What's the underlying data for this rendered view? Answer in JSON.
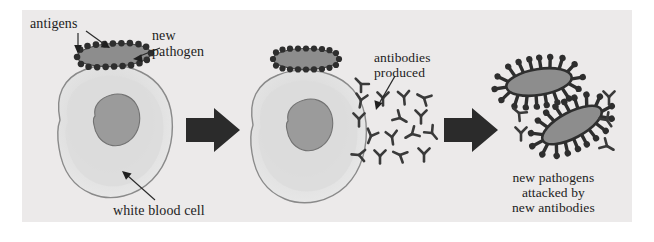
{
  "figure": {
    "panel_background": "#eceaea",
    "page_background": "#ffffff"
  },
  "labels": {
    "antigens": "antigens",
    "new_pathogen": "new\npathogen",
    "antibodies_produced": "antibodies\nproduced",
    "white_blood_cell": "white blood cell",
    "result": "new pathogens\nattacked by\nnew antibodies"
  },
  "colors": {
    "cell_fill": "#e2e2e2",
    "cell_inner_fill": "#d2d2d2",
    "cell_outline": "#8a8a8a",
    "nucleus_fill": "#9b9b9b",
    "nucleus_outline": "#6f6f6f",
    "pathogen_body": "#8d8d8d",
    "pathogen_outline": "#3b3b3b",
    "antigen_dot": "#2e2e2e",
    "antibody": "#3a3a3a",
    "arrow": "#2b2b2b",
    "leader_line": "#2a2a2a",
    "text": "#1c1c1c"
  },
  "stages": [
    {
      "id": "stage-1",
      "name": "pathogen-binds-to-white-blood-cell",
      "elements": [
        "white-blood-cell",
        "nucleus",
        "new-pathogen",
        "antigens"
      ]
    },
    {
      "id": "stage-2",
      "name": "antibodies-produced",
      "elements": [
        "white-blood-cell",
        "nucleus",
        "new-pathogen",
        "antibodies"
      ],
      "antibody_count": 16
    },
    {
      "id": "stage-3",
      "name": "pathogens-attacked-by-antibodies",
      "elements": [
        "pathogen-a",
        "pathogen-b",
        "antibodies"
      ],
      "pathogen_count": 2,
      "antibody_count": 5
    }
  ],
  "arrows": [
    {
      "name": "arrow-stage1-to-stage2",
      "from": "stage-1",
      "to": "stage-2"
    },
    {
      "name": "arrow-stage2-to-stage3",
      "from": "stage-2",
      "to": "stage-3"
    }
  ],
  "leaders": [
    {
      "name": "leader-antigens-left",
      "points_to": "antigen-dot"
    },
    {
      "name": "leader-antigens-right",
      "points_to": "antigen-dot"
    },
    {
      "name": "leader-new-pathogen",
      "points_to": "new-pathogen"
    },
    {
      "name": "leader-antibodies",
      "points_to": "antibody-cluster"
    },
    {
      "name": "leader-white-blood-cell",
      "points_to": "white-blood-cell"
    }
  ]
}
